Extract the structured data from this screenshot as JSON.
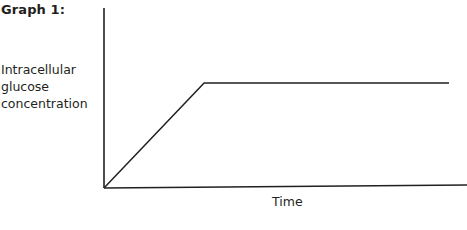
{
  "chart_data": {
    "type": "line",
    "title": "Graph 1:",
    "xlabel": "Time",
    "ylabel": "Intracellular glucose concentration",
    "ylabel_lines": [
      "Intracellular",
      "glucose",
      "concentration"
    ],
    "grid": false,
    "legend": null,
    "axis_ticks": false,
    "series": [
      {
        "name": "Intracellular glucose concentration",
        "x": [
          0,
          0.29,
          1.0
        ],
        "y": [
          0,
          0.59,
          0.59
        ],
        "description": "Linear rise from origin, then plateau at constant level"
      }
    ],
    "xlim": [
      0,
      1
    ],
    "ylim": [
      0,
      1
    ]
  },
  "colors": {
    "line": "#231f20",
    "background": "#ffffff"
  }
}
